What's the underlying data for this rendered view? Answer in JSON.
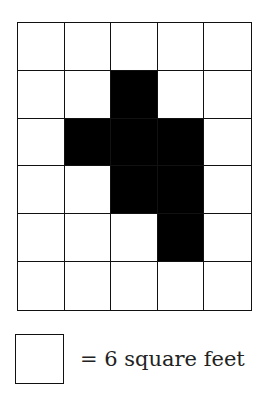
{
  "figure": {
    "grid": {
      "rows": 6,
      "cols": 5,
      "shaded_cells": [
        [
          1,
          2
        ],
        [
          2,
          1
        ],
        [
          2,
          2
        ],
        [
          2,
          3
        ],
        [
          3,
          2
        ],
        [
          3,
          3
        ],
        [
          4,
          3
        ]
      ],
      "fill_color": "#000000",
      "line_color": "#111111"
    },
    "legend": {
      "text": "= 6 square feet",
      "unit_area": 6,
      "unit": "square feet"
    }
  }
}
